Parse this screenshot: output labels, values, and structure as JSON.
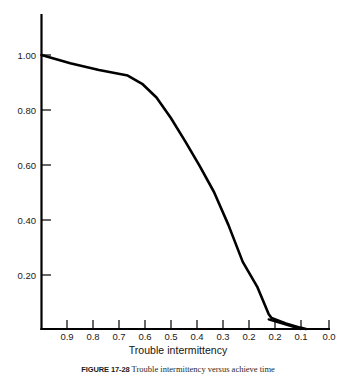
{
  "figure": {
    "caption_label": "FIGURE 17-28",
    "caption_text": "Trouble intermittency versus achieve time"
  },
  "chart_data": {
    "type": "line",
    "title": "",
    "xlabel": "Trouble intermittency",
    "ylabel": "",
    "xlim": [
      1.0,
      0.0
    ],
    "ylim": [
      0.0,
      1.08
    ],
    "x_axis_reversed": true,
    "grid": false,
    "legend": null,
    "x_tick_labels": [
      "0.9",
      "0.8",
      "0.7",
      "0.6",
      "0.5",
      "0.4",
      "0.3",
      "0.2",
      "0.2",
      "0.1",
      "0.0"
    ],
    "x_tick_values": [
      0.9,
      0.8,
      0.7,
      0.6,
      0.5,
      0.4,
      0.3,
      0.25,
      0.2,
      0.1,
      0.0
    ],
    "y_tick_labels": [
      "1.00",
      "0.80",
      "0.60",
      "0.40",
      "0.20"
    ],
    "y_tick_values": [
      1.0,
      0.8,
      0.6,
      0.4,
      0.2
    ],
    "line_color": "#000000",
    "line_width": 2.6,
    "series": [
      {
        "name": "Trouble intermittency curve",
        "x": [
          1.0,
          0.9,
          0.8,
          0.7,
          0.65,
          0.6,
          0.55,
          0.5,
          0.45,
          0.4,
          0.35,
          0.3,
          0.25,
          0.21,
          0.2,
          0.15,
          0.1,
          0.08
        ],
        "y": [
          1.0,
          0.97,
          0.945,
          0.925,
          0.895,
          0.845,
          0.77,
          0.685,
          0.595,
          0.5,
          0.38,
          0.245,
          0.155,
          0.055,
          0.04,
          0.02,
          0.005,
          0.0
        ]
      },
      {
        "name": "Lower tail segment",
        "x": [
          0.21,
          0.1
        ],
        "y": [
          0.035,
          0.0
        ]
      }
    ]
  }
}
